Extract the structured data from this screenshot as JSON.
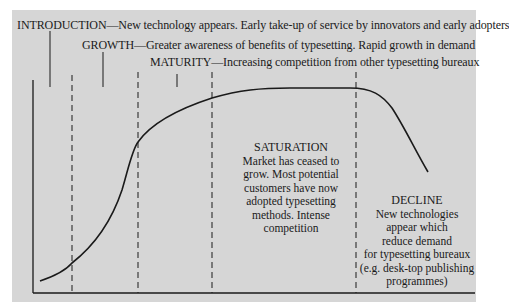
{
  "diagram": {
    "background_color": "#d6d6d6",
    "line_color": "#1a1a1a",
    "stages": [
      {
        "name": "INTRODUCTION",
        "text": "INTRODUCTION—New technology appears. Early take-up of service by innovators and early adopters"
      },
      {
        "name": "GROWTH",
        "text": "GROWTH—Greater awareness of benefits of typesetting. Rapid growth in demand"
      },
      {
        "name": "MATURITY",
        "text": "MATURITY—Increasing competition from other typesetting bureaux"
      },
      {
        "name": "SATURATION",
        "lines": [
          "Market has ceased to",
          "grow. Most potential",
          "customers have now",
          "adopted typesetting",
          "methods. Intense",
          "competition"
        ]
      },
      {
        "name": "DECLINE",
        "lines": [
          "New technologies",
          "appear which",
          "reduce demand",
          "for typesetting bureaux",
          "(e.g. desk-top publishing",
          "programmes)"
        ]
      }
    ]
  }
}
